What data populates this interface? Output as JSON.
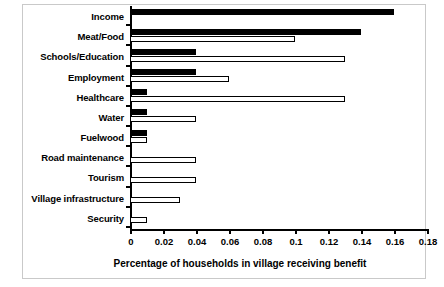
{
  "chart_data": {
    "type": "bar",
    "orientation": "horizontal",
    "title": "",
    "xlabel": "Percentage of households in village receiving benefit",
    "ylabel": "",
    "xlim": [
      0,
      0.18
    ],
    "xticks": [
      0,
      0.02,
      0.04,
      0.06,
      0.08,
      0.1,
      0.12,
      0.14,
      0.16,
      0.18
    ],
    "xtick_labels": [
      "0",
      "0.02",
      "0.04",
      "0.06",
      "0.08",
      "0.1",
      "0.12",
      "0.14",
      "0.16",
      "0.18"
    ],
    "grid": false,
    "legend": "none",
    "categories": [
      "Income",
      "Meat/Food",
      "Schools/Education",
      "Employment",
      "Healthcare",
      "Water",
      "Fuelwood",
      "Road maintenance",
      "Tourism",
      "Village infrastructure",
      "Security"
    ],
    "series": [
      {
        "name": "black",
        "color": "#000000",
        "values": [
          0.16,
          0.14,
          0.04,
          0.04,
          0.01,
          0.01,
          0.01,
          0,
          0,
          0,
          0
        ]
      },
      {
        "name": "white",
        "color": "#ffffff",
        "values": [
          0,
          0.1,
          0.13,
          0.06,
          0.13,
          0.04,
          0.01,
          0.04,
          0.04,
          0.03,
          0.01
        ]
      }
    ]
  }
}
